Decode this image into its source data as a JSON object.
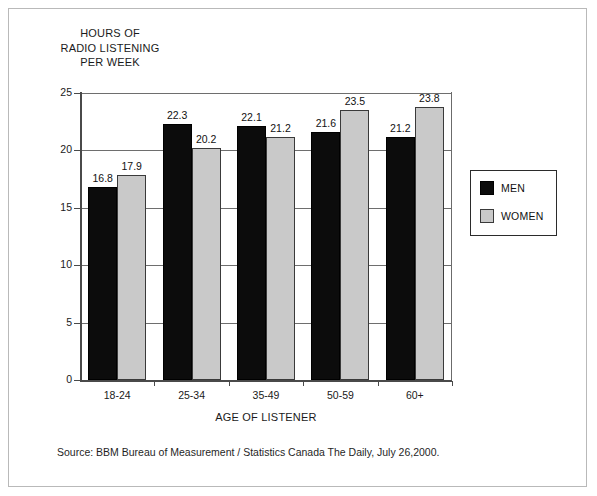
{
  "figure": {
    "border_color": "#b9b9b9",
    "background": "#ffffff"
  },
  "y_axis_title_lines": [
    "HOURS OF",
    "RADIO LISTENING",
    "PER WEEK"
  ],
  "x_axis_title": "AGE OF LISTENER",
  "source_note": "Source: BBM Bureau of Measurement / Statistics Canada The Daily, July 26,2000.",
  "legend": {
    "entries": [
      {
        "label": "MEN",
        "color": "#0c0c0c"
      },
      {
        "label": "WOMEN",
        "color": "#c9c9c9"
      }
    ]
  },
  "chart_data": {
    "type": "bar",
    "title": "",
    "subtitle": "",
    "xlabel": "AGE OF LISTENER",
    "ylabel": "HOURS OF RADIO LISTENING PER WEEK",
    "categories": [
      "18-24",
      "25-34",
      "35-49",
      "50-59",
      "60+"
    ],
    "series": [
      {
        "name": "MEN",
        "color": "#0c0c0c",
        "values": [
          16.8,
          22.3,
          22.1,
          21.6,
          21.2
        ]
      },
      {
        "name": "WOMEN",
        "color": "#c9c9c9",
        "values": [
          17.9,
          20.2,
          21.2,
          23.5,
          23.8
        ]
      }
    ],
    "ylim": [
      0,
      25
    ],
    "yticks": [
      0,
      5,
      10,
      15,
      20,
      25
    ],
    "ytick_labels": [
      "0",
      "5",
      "10",
      "15",
      "20",
      "25"
    ],
    "grid": "horizontal",
    "legend_position": "right-outside",
    "data_labels": true
  }
}
